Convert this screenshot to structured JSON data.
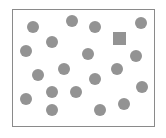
{
  "figure": {
    "frame": {
      "x": 12,
      "y": 9,
      "width": 143,
      "height": 118,
      "stroke": "#8a8a8a"
    },
    "shape_color": "#939393",
    "circle_radius": 6,
    "circles": [
      {
        "cx": 33,
        "cy": 27
      },
      {
        "cx": 72,
        "cy": 21
      },
      {
        "cx": 95,
        "cy": 27
      },
      {
        "cx": 141,
        "cy": 23
      },
      {
        "cx": 52,
        "cy": 42
      },
      {
        "cx": 26,
        "cy": 51
      },
      {
        "cx": 88,
        "cy": 54
      },
      {
        "cx": 136,
        "cy": 56
      },
      {
        "cx": 64,
        "cy": 69
      },
      {
        "cx": 117,
        "cy": 69
      },
      {
        "cx": 38,
        "cy": 75
      },
      {
        "cx": 95,
        "cy": 79
      },
      {
        "cx": 142,
        "cy": 87
      },
      {
        "cx": 52,
        "cy": 92
      },
      {
        "cx": 76,
        "cy": 92
      },
      {
        "cx": 26,
        "cy": 99
      },
      {
        "cx": 52,
        "cy": 110
      },
      {
        "cx": 124,
        "cy": 104
      },
      {
        "cx": 100,
        "cy": 110
      }
    ],
    "squares": [
      {
        "x": 113,
        "y": 32,
        "size": 13
      }
    ],
    "counts": {
      "circles": 19,
      "squares": 1
    }
  }
}
